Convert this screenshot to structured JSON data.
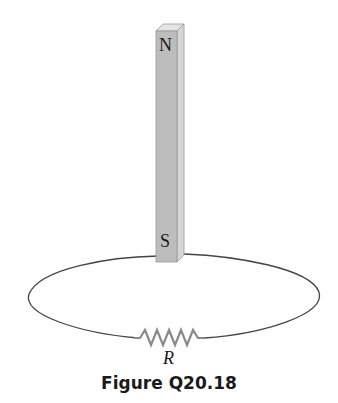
{
  "figure": {
    "caption": "Figure Q20.18",
    "magnet": {
      "north_label": "N",
      "south_label": "S",
      "front_color": "#bdbdbd",
      "side_color": "#d8d8d8",
      "top_color": "#e4e4e4"
    },
    "loop": {
      "stroke_color": "#444444"
    },
    "resistor": {
      "label": "R",
      "color": "#8a8a8a"
    }
  }
}
